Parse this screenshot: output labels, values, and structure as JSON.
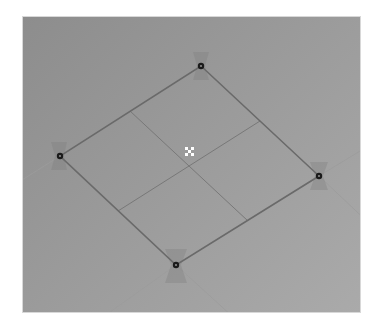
{
  "viewport": {
    "type": "3d-viewport",
    "background_top_left": "#8d8d8d",
    "background_bottom_right": "#aaaaaa"
  },
  "mesh": {
    "name": "plane",
    "edge_color": "#6e6e6e",
    "subdivision_color": "#7a7a7a",
    "guide_color": "#9c9c9c",
    "vertices": [
      {
        "id": "top",
        "x": 178,
        "y": 49
      },
      {
        "id": "right",
        "x": 296,
        "y": 159
      },
      {
        "id": "bottom",
        "x": 153,
        "y": 248
      },
      {
        "id": "left",
        "x": 37,
        "y": 139
      }
    ],
    "center": {
      "x": 166,
      "y": 135
    }
  },
  "icons": {
    "vertex_handle": "vertex-handle-icon",
    "pivot": "pivot-icon"
  }
}
